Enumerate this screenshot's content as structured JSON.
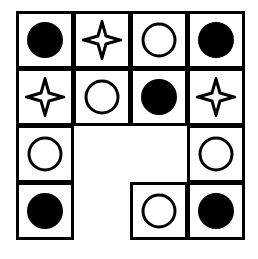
{
  "puzzle": {
    "grid": {
      "origin_x": 16,
      "origin_y": 11,
      "cell_size": 57,
      "rows": 4,
      "cols": 4
    },
    "cells": [
      {
        "row": 0,
        "col": 0,
        "symbol": "filled-circle"
      },
      {
        "row": 0,
        "col": 1,
        "symbol": "four-point-star"
      },
      {
        "row": 0,
        "col": 2,
        "symbol": "hollow-circle"
      },
      {
        "row": 0,
        "col": 3,
        "symbol": "filled-circle"
      },
      {
        "row": 1,
        "col": 0,
        "symbol": "four-point-star"
      },
      {
        "row": 1,
        "col": 1,
        "symbol": "hollow-circle"
      },
      {
        "row": 1,
        "col": 2,
        "symbol": "filled-circle"
      },
      {
        "row": 1,
        "col": 3,
        "symbol": "four-point-star"
      },
      {
        "row": 2,
        "col": 0,
        "symbol": "hollow-circle"
      },
      {
        "row": 2,
        "col": 3,
        "symbol": "hollow-circle"
      },
      {
        "row": 3,
        "col": 0,
        "symbol": "filled-circle"
      },
      {
        "row": 3,
        "col": 2,
        "symbol": "hollow-circle"
      },
      {
        "row": 3,
        "col": 3,
        "symbol": "filled-circle"
      }
    ],
    "empty_cells": [
      {
        "row": 2,
        "col": 1
      },
      {
        "row": 2,
        "col": 2
      },
      {
        "row": 3,
        "col": 1
      }
    ],
    "colors": {
      "stroke": "#000000",
      "background": "#ffffff"
    }
  }
}
